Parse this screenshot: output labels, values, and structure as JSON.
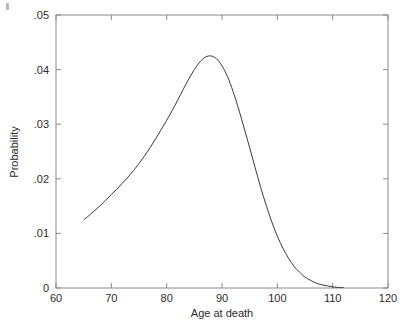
{
  "figure": {
    "background_color": "#ffffff",
    "frame_color": "#8a8a8a",
    "curve_color": "#3a3a3a",
    "text_color": "#2b2b2b"
  },
  "chart_data": {
    "type": "line",
    "title": "",
    "xlabel": "Age at death",
    "ylabel": "Probability",
    "xlim": [
      60,
      120
    ],
    "ylim": [
      0,
      0.05
    ],
    "xticks": [
      60,
      70,
      80,
      90,
      100,
      110,
      120
    ],
    "xtick_labels": [
      "60",
      "70",
      "80",
      "90",
      "100",
      "110",
      "120"
    ],
    "yticks": [
      0,
      0.01,
      0.02,
      0.03,
      0.04,
      0.05
    ],
    "ytick_labels": [
      "0",
      ".01",
      ".02",
      ".03",
      ".04",
      ".05"
    ],
    "grid": false,
    "legend": null,
    "series": [
      {
        "name": "Probability of death at age",
        "x": [
          65,
          66,
          67,
          68,
          69,
          70,
          71,
          72,
          73,
          74,
          75,
          76,
          77,
          78,
          79,
          80,
          81,
          82,
          83,
          84,
          85,
          86,
          87,
          88,
          89,
          90,
          91,
          92,
          93,
          94,
          95,
          96,
          97,
          98,
          99,
          100,
          101,
          102,
          103,
          104,
          105,
          106,
          107,
          108,
          109,
          110,
          111,
          112
        ],
        "values": [
          0.0125,
          0.0133,
          0.0142,
          0.0151,
          0.0161,
          0.0171,
          0.0181,
          0.0192,
          0.0203,
          0.0215,
          0.0228,
          0.0242,
          0.0257,
          0.0273,
          0.029,
          0.0307,
          0.0325,
          0.0344,
          0.0364,
          0.0383,
          0.04,
          0.0414,
          0.0423,
          0.0425,
          0.042,
          0.0407,
          0.0387,
          0.036,
          0.0328,
          0.0293,
          0.0257,
          0.022,
          0.0184,
          0.0151,
          0.0121,
          0.0095,
          0.0073,
          0.0055,
          0.004,
          0.0029,
          0.002,
          0.0014,
          0.0009,
          0.0006,
          0.0004,
          0.0002,
          0.0001,
          0.0001
        ]
      }
    ]
  }
}
